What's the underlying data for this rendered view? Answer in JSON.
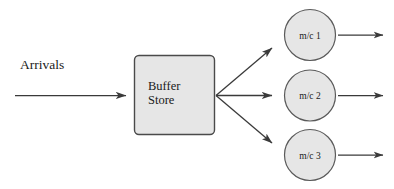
{
  "diagram": {
    "type": "queueing-system-flow-diagram",
    "background_color": "#ffffff",
    "stroke_color": "#3a3a3a",
    "fill_color": "#e6e6e6",
    "text_color": "#1a1a1a",
    "source_label": {
      "text": "Arrivals"
    },
    "buffer": {
      "line1": "Buffer",
      "line2": "Store"
    },
    "machines": [
      {
        "label": "m/c 1"
      },
      {
        "label": "m/c 2"
      },
      {
        "label": "m/c 3"
      }
    ],
    "arrows": {
      "arrival_arrow": "arrow-arrivals-to-buffer",
      "branch_1": "arrow-buffer-to-mc1",
      "branch_2": "arrow-buffer-to-mc2",
      "branch_3": "arrow-buffer-to-mc3",
      "departure_1": "arrow-mc1-departure",
      "departure_2": "arrow-mc2-departure",
      "departure_3": "arrow-mc3-departure"
    }
  }
}
